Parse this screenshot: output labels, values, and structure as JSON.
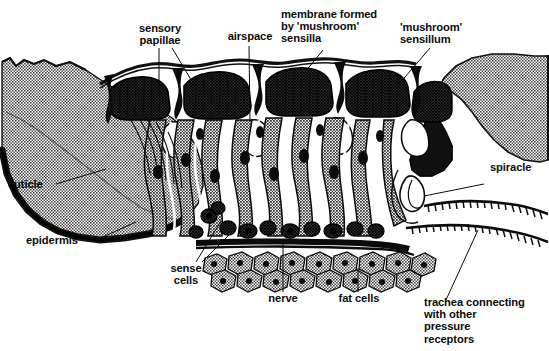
{
  "figure": {
    "title_semantic": "insect-pressure-receptor-cross-section",
    "background_color": "#ffffff",
    "ink_color": "#0b0b0b",
    "cuticle_fill": "#8d8d8d",
    "epidermis_fill": "#171717",
    "fatcell_fill": "#6f6f6f"
  },
  "labels": {
    "sensory_papillae": "sensory\npapillae",
    "airspace": "airspace",
    "membrane": "membrane formed\nby 'mushroom'\nsensilla",
    "mushroom_sensillum": "'mushroom'\nsensillum",
    "spiracle": "spiracle",
    "cuticle": "cuticle",
    "epidermis": "epidermis",
    "sense_cells": "sense\ncells",
    "nerve": "nerve",
    "fat_cells": "fat cells",
    "trachea": "trachea connecting\nwith other\npressure\nreceptors"
  }
}
